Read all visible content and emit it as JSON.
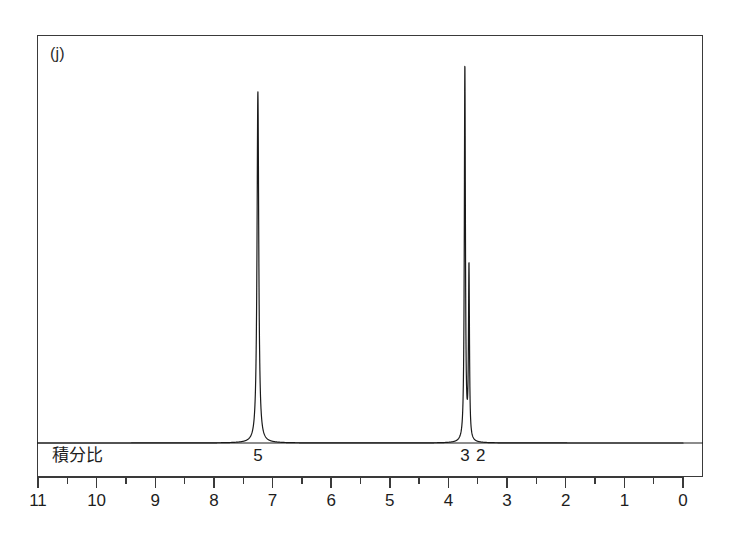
{
  "figure": {
    "panel_label": "(j)",
    "frame": {
      "x": 37,
      "y": 35,
      "width": 666,
      "height": 442
    },
    "baseline_y": 443
  },
  "integration": {
    "row_label": "積分比",
    "entries": [
      {
        "label": "5",
        "ppm": 7.25
      },
      {
        "label": "3",
        "ppm": 3.72
      },
      {
        "label": "2",
        "ppm": 3.45
      }
    ]
  },
  "axis": {
    "label": "",
    "unit": "ppm",
    "min": 0,
    "max": 11,
    "reversed": true,
    "major_ticks": [
      11,
      10,
      9,
      8,
      7,
      6,
      5,
      4,
      3,
      2,
      1,
      0
    ],
    "minor_tick_step": 0.5,
    "tick_labels": [
      "11",
      "10",
      "9",
      "8",
      "7",
      "6",
      "5",
      "4",
      "3",
      "2",
      "1",
      "0"
    ],
    "pixel_left": 38,
    "pixel_right": 683
  },
  "chart_data": {
    "type": "line",
    "title": "",
    "subtitle": "",
    "xlabel": "",
    "ylabel": "",
    "xlim": [
      11,
      0
    ],
    "ylim": [
      0,
      1
    ],
    "grid": false,
    "legend": "none",
    "x_axis_reversed": true,
    "series": [
      {
        "name": "1H NMR trace",
        "color": "#1a1a1a",
        "peaks": [
          {
            "ppm": 7.25,
            "height": 0.935,
            "width": 0.035,
            "integration": "5",
            "assignment": "aromatic"
          },
          {
            "ppm": 3.72,
            "height": 1.0,
            "width": 0.022,
            "integration": "3",
            "assignment": "methyl/methoxy"
          },
          {
            "ppm": 3.65,
            "height": 0.46,
            "width": 0.02,
            "integration": "2",
            "assignment": "methylene"
          }
        ],
        "baseline": 0.0
      }
    ],
    "annotations": [
      {
        "text": "(j)",
        "x": 10.75,
        "y": 0.97
      },
      {
        "text": "積分比",
        "x": 10.5,
        "y": -0.06
      },
      {
        "text": "5",
        "x": 7.25,
        "y": -0.06
      },
      {
        "text": "3",
        "x": 3.78,
        "y": -0.06
      },
      {
        "text": "2",
        "x": 3.5,
        "y": -0.06
      }
    ]
  },
  "colors": {
    "trace": "#1a1a1a",
    "frame": "#3a3a3a",
    "background": "#ffffff",
    "text": "#1d1d1d"
  }
}
